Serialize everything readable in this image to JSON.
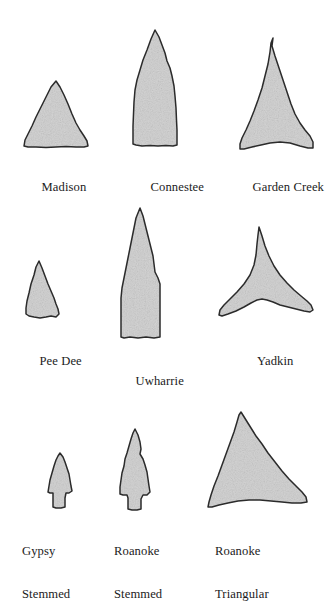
{
  "figure": {
    "kind": "projectile-point-typology-plate",
    "background_color": "#ffffff",
    "outline_color": "#2b2b2b",
    "fill_color": "#dcdcdc",
    "fill_texture": "speckled-stipple",
    "label_color": "#1b1b1b",
    "label_font_size_px": 12.6,
    "rows": 3,
    "columns": 3
  },
  "points": [
    {
      "id": "madison",
      "label_line1": "Madison",
      "label_line2": "",
      "row": 1,
      "column": 1,
      "shape": "small-equilateral-triangle-straight-base",
      "label_x": 22,
      "label_y": 172,
      "art_x": 18,
      "art_y": 78,
      "art_w": 76,
      "art_h": 78
    },
    {
      "id": "connestee",
      "label_line1": "Connestee",
      "label_line2": "",
      "row": 1,
      "column": 2,
      "shape": "elongate-lanceolate-straight-base",
      "label_x": 131,
      "label_y": 172,
      "art_x": 126,
      "art_y": 26,
      "art_w": 62,
      "art_h": 128
    },
    {
      "id": "garden-creek",
      "label_line1": "Garden Creek",
      "label_line2": "",
      "row": 1,
      "column": 3,
      "shape": "tall-narrow-triangle-concave-base-flaring-ears",
      "label_x": 233,
      "label_y": 172,
      "art_x": 232,
      "art_y": 34,
      "art_w": 90,
      "art_h": 124
    },
    {
      "id": "pee-dee",
      "label_line1": "Pee Dee",
      "label_line2": "",
      "row": 2,
      "column": 1,
      "shape": "small-triangle-slightly-concave-base",
      "label_x": 20,
      "label_y": 346,
      "art_x": 18,
      "art_y": 256,
      "art_w": 60,
      "art_h": 72
    },
    {
      "id": "uwharrie",
      "label_line1": "Uwharrie",
      "label_line2": "",
      "row": 2,
      "column": 2,
      "shape": "long-narrow-lanceolate-parallel-sides",
      "label_x": 116,
      "label_y": 366,
      "art_x": 112,
      "art_y": 204,
      "art_w": 62,
      "art_h": 142
    },
    {
      "id": "yadkin",
      "label_line1": "Yadkin",
      "label_line2": "",
      "row": 2,
      "column": 3,
      "shape": "broad-triangle-deeply-concave-base-sharp-barbs",
      "label_x": 238,
      "label_y": 346,
      "art_x": 212,
      "art_y": 222,
      "art_w": 108,
      "art_h": 110
    },
    {
      "id": "gypsy-stemmed",
      "label_line1": "Gypsy",
      "label_line2": "Stemmed",
      "row": 3,
      "column": 1,
      "shape": "small-stemmed-point-with-shoulders",
      "label_x": 22,
      "label_y": 521,
      "art_x": 42,
      "art_y": 448,
      "art_w": 46,
      "art_h": 66
    },
    {
      "id": "roanoke-stemmed",
      "label_line1": "Roanoke",
      "label_line2": "Stemmed",
      "row": 3,
      "column": 2,
      "shape": "medium-stemmed-point-with-serrated-blade",
      "label_x": 114,
      "label_y": 521,
      "art_x": 110,
      "art_y": 424,
      "art_w": 56,
      "art_h": 92
    },
    {
      "id": "roanoke-triangular",
      "label_line1": "Roanoke",
      "label_line2": "Triangular",
      "row": 3,
      "column": 3,
      "shape": "large-asymmetric-triangle-recurved-base",
      "label_x": 215,
      "label_y": 521,
      "art_x": 200,
      "art_y": 406,
      "art_w": 122,
      "art_h": 110
    }
  ]
}
